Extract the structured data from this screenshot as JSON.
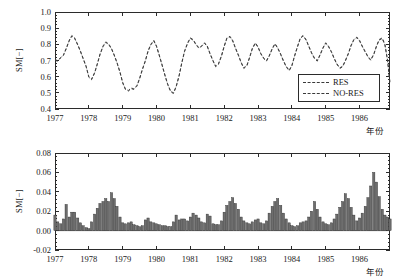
{
  "figure": {
    "background": "#ffffff",
    "line_color": "#3a3a3a",
    "bar_color": "#6e6e6e",
    "bar_edge_color": "#2b2b2b",
    "axis_color": "#2b2b2b"
  },
  "panels": [
    {
      "id": "top",
      "ylabel": "SM[−]",
      "xlabel": "年份",
      "yticks": [
        "1.0",
        "0.9",
        "0.8",
        "0.7",
        "0.6",
        "0.5",
        "0.4"
      ],
      "xticks": [
        "1977",
        "1978",
        "1979",
        "1980",
        "1981",
        "1982",
        "1983",
        "1984",
        "1985",
        "1986"
      ],
      "legend": {
        "items": [
          {
            "label": "RES",
            "style": "dashed"
          },
          {
            "label": "NO-RES",
            "style": "dashed"
          }
        ]
      }
    },
    {
      "id": "bottom",
      "ylabel": "SM[−]",
      "xlabel": "年份",
      "yticks": [
        "0.08",
        "0.06",
        "0.04",
        "0.02",
        "0.00",
        "-0.02"
      ],
      "xticks": [
        "1977",
        "1978",
        "1979",
        "1980",
        "1981",
        "1982",
        "1983",
        "1984",
        "1985",
        "1986"
      ]
    }
  ],
  "chart_data": [
    {
      "type": "line",
      "panel": "top",
      "title": "",
      "xlabel": "年份",
      "ylabel": "SM[−]",
      "xlim": [
        1977.0,
        1986.9
      ],
      "ylim": [
        0.4,
        1.0
      ],
      "grid": false,
      "legend_position": "lower-right",
      "x": [
        1977.0,
        1977.08,
        1977.17,
        1977.25,
        1977.33,
        1977.42,
        1977.5,
        1977.58,
        1977.67,
        1977.75,
        1977.83,
        1977.92,
        1978.0,
        1978.08,
        1978.17,
        1978.25,
        1978.33,
        1978.42,
        1978.5,
        1978.58,
        1978.67,
        1978.75,
        1978.83,
        1978.92,
        1979.0,
        1979.08,
        1979.17,
        1979.25,
        1979.33,
        1979.42,
        1979.5,
        1979.58,
        1979.67,
        1979.75,
        1979.83,
        1979.92,
        1980.0,
        1980.08,
        1980.17,
        1980.25,
        1980.33,
        1980.42,
        1980.5,
        1980.58,
        1980.67,
        1980.75,
        1980.83,
        1980.92,
        1981.0,
        1981.08,
        1981.17,
        1981.25,
        1981.33,
        1981.42,
        1981.5,
        1981.58,
        1981.67,
        1981.75,
        1981.83,
        1981.92,
        1982.0,
        1982.08,
        1982.17,
        1982.25,
        1982.33,
        1982.42,
        1982.5,
        1982.58,
        1982.67,
        1982.75,
        1982.83,
        1982.92,
        1983.0,
        1983.08,
        1983.17,
        1983.25,
        1983.33,
        1983.42,
        1983.5,
        1983.58,
        1983.67,
        1983.75,
        1983.83,
        1983.92,
        1984.0,
        1984.08,
        1984.17,
        1984.25,
        1984.33,
        1984.42,
        1984.5,
        1984.58,
        1984.67,
        1984.75,
        1984.83,
        1984.92,
        1985.0,
        1985.08,
        1985.17,
        1985.25,
        1985.33,
        1985.42,
        1985.5,
        1985.58,
        1985.67,
        1985.75,
        1985.83,
        1985.92,
        1986.0,
        1986.08,
        1986.17,
        1986.25,
        1986.33,
        1986.42,
        1986.5,
        1986.58,
        1986.67,
        1986.75,
        1986.83,
        1986.9
      ],
      "series": [
        {
          "name": "RES",
          "style": "dashed",
          "values": [
            0.705,
            0.7,
            0.72,
            0.735,
            0.775,
            0.825,
            0.855,
            0.84,
            0.8,
            0.76,
            0.715,
            0.665,
            0.6,
            0.585,
            0.625,
            0.68,
            0.74,
            0.79,
            0.815,
            0.805,
            0.775,
            0.735,
            0.69,
            0.63,
            0.565,
            0.525,
            0.515,
            0.53,
            0.525,
            0.545,
            0.59,
            0.645,
            0.7,
            0.76,
            0.8,
            0.825,
            0.79,
            0.735,
            0.67,
            0.61,
            0.555,
            0.51,
            0.5,
            0.54,
            0.61,
            0.69,
            0.76,
            0.81,
            0.84,
            0.83,
            0.8,
            0.78,
            0.79,
            0.81,
            0.79,
            0.745,
            0.7,
            0.665,
            0.68,
            0.73,
            0.79,
            0.84,
            0.85,
            0.825,
            0.78,
            0.735,
            0.69,
            0.655,
            0.67,
            0.72,
            0.775,
            0.81,
            0.785,
            0.745,
            0.715,
            0.7,
            0.73,
            0.775,
            0.805,
            0.78,
            0.74,
            0.7,
            0.665,
            0.64,
            0.67,
            0.73,
            0.79,
            0.84,
            0.855,
            0.83,
            0.79,
            0.75,
            0.715,
            0.7,
            0.735,
            0.78,
            0.81,
            0.79,
            0.755,
            0.715,
            0.68,
            0.655,
            0.665,
            0.7,
            0.745,
            0.795,
            0.83,
            0.845,
            0.825,
            0.79,
            0.755,
            0.725,
            0.705,
            0.74,
            0.79,
            0.83,
            0.84,
            0.8,
            0.7,
            0.56
          ]
        },
        {
          "name": "NO-RES",
          "style": "dashed",
          "values": [
            0.7,
            0.696,
            0.716,
            0.731,
            0.771,
            0.821,
            0.851,
            0.836,
            0.796,
            0.756,
            0.711,
            0.661,
            0.596,
            0.581,
            0.621,
            0.676,
            0.736,
            0.786,
            0.811,
            0.801,
            0.771,
            0.731,
            0.686,
            0.626,
            0.561,
            0.521,
            0.511,
            0.526,
            0.521,
            0.541,
            0.586,
            0.641,
            0.696,
            0.756,
            0.796,
            0.821,
            0.786,
            0.731,
            0.666,
            0.606,
            0.551,
            0.506,
            0.496,
            0.536,
            0.606,
            0.686,
            0.756,
            0.806,
            0.836,
            0.826,
            0.796,
            0.776,
            0.786,
            0.806,
            0.786,
            0.741,
            0.696,
            0.661,
            0.676,
            0.726,
            0.786,
            0.836,
            0.846,
            0.821,
            0.776,
            0.731,
            0.686,
            0.651,
            0.666,
            0.716,
            0.771,
            0.806,
            0.781,
            0.741,
            0.711,
            0.696,
            0.726,
            0.771,
            0.801,
            0.776,
            0.736,
            0.696,
            0.661,
            0.636,
            0.666,
            0.726,
            0.786,
            0.836,
            0.851,
            0.826,
            0.786,
            0.746,
            0.711,
            0.696,
            0.731,
            0.776,
            0.806,
            0.786,
            0.751,
            0.711,
            0.676,
            0.651,
            0.661,
            0.696,
            0.741,
            0.791,
            0.826,
            0.841,
            0.821,
            0.786,
            0.751,
            0.721,
            0.701,
            0.736,
            0.786,
            0.826,
            0.836,
            0.796,
            0.696,
            0.556
          ]
        }
      ]
    },
    {
      "type": "bar",
      "panel": "bottom",
      "title": "",
      "xlabel": "年份",
      "ylabel": "SM[−]",
      "xlim": [
        1977.0,
        1986.9
      ],
      "ylim": [
        -0.02,
        0.08
      ],
      "grid": false,
      "baseline": 0.0,
      "x": [
        1977.0,
        1977.08,
        1977.17,
        1977.25,
        1977.33,
        1977.42,
        1977.5,
        1977.58,
        1977.67,
        1977.75,
        1977.83,
        1977.92,
        1978.0,
        1978.08,
        1978.17,
        1978.25,
        1978.33,
        1978.42,
        1978.5,
        1978.58,
        1978.67,
        1978.75,
        1978.83,
        1978.92,
        1979.0,
        1979.08,
        1979.17,
        1979.25,
        1979.33,
        1979.42,
        1979.5,
        1979.58,
        1979.67,
        1979.75,
        1979.83,
        1979.92,
        1980.0,
        1980.08,
        1980.17,
        1980.25,
        1980.33,
        1980.42,
        1980.5,
        1980.58,
        1980.67,
        1980.75,
        1980.83,
        1980.92,
        1981.0,
        1981.08,
        1981.17,
        1981.25,
        1981.33,
        1981.42,
        1981.5,
        1981.58,
        1981.67,
        1981.75,
        1981.83,
        1981.92,
        1982.0,
        1982.08,
        1982.17,
        1982.25,
        1982.33,
        1982.42,
        1982.5,
        1982.58,
        1982.67,
        1982.75,
        1982.83,
        1982.92,
        1983.0,
        1983.08,
        1983.17,
        1983.25,
        1983.33,
        1983.42,
        1983.5,
        1983.58,
        1983.67,
        1983.75,
        1983.83,
        1983.92,
        1984.0,
        1984.08,
        1984.17,
        1984.25,
        1984.33,
        1984.42,
        1984.5,
        1984.58,
        1984.67,
        1984.75,
        1984.83,
        1984.92,
        1985.0,
        1985.08,
        1985.17,
        1985.25,
        1985.33,
        1985.42,
        1985.5,
        1985.58,
        1985.67,
        1985.75,
        1985.83,
        1985.92,
        1986.0,
        1986.08,
        1986.17,
        1986.25,
        1986.33,
        1986.42,
        1986.5,
        1986.58,
        1986.67,
        1986.75,
        1986.83,
        1986.9
      ],
      "values": [
        0.016,
        0.009,
        0.007,
        0.012,
        0.027,
        0.014,
        0.019,
        0.019,
        0.013,
        0.008,
        0.005,
        0.003,
        0.002,
        0.009,
        0.017,
        0.023,
        0.028,
        0.03,
        0.033,
        0.03,
        0.039,
        0.033,
        0.025,
        0.014,
        0.008,
        0.007,
        0.008,
        0.009,
        0.006,
        0.005,
        0.004,
        0.005,
        0.011,
        0.013,
        0.009,
        0.008,
        0.007,
        0.006,
        0.005,
        0.005,
        0.004,
        0.004,
        0.009,
        0.016,
        0.011,
        0.012,
        0.012,
        0.01,
        0.014,
        0.018,
        0.016,
        0.013,
        0.009,
        0.008,
        0.017,
        0.015,
        0.007,
        0.006,
        0.006,
        0.01,
        0.019,
        0.026,
        0.03,
        0.034,
        0.028,
        0.022,
        0.014,
        0.01,
        0.008,
        0.007,
        0.009,
        0.011,
        0.012,
        0.008,
        0.007,
        0.01,
        0.018,
        0.025,
        0.03,
        0.033,
        0.026,
        0.018,
        0.012,
        0.008,
        0.005,
        0.004,
        0.005,
        0.008,
        0.009,
        0.01,
        0.014,
        0.02,
        0.03,
        0.022,
        0.014,
        0.009,
        0.007,
        0.006,
        0.008,
        0.012,
        0.017,
        0.024,
        0.03,
        0.038,
        0.033,
        0.024,
        0.016,
        0.01,
        0.013,
        0.018,
        0.025,
        0.034,
        0.046,
        0.06,
        0.05,
        0.035,
        0.022,
        0.016,
        0.014,
        0.012
      ]
    }
  ]
}
